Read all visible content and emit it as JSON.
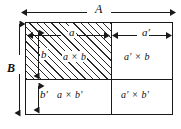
{
  "figure": {
    "colors": {
      "line": "#1a1a1a",
      "hatch": "#2a2a2a",
      "background": "#ffffff",
      "text": "#0d0d0d"
    }
  },
  "dimensions": {
    "total_width_label": "A",
    "total_height_label": "B",
    "left_width_label": "a",
    "right_width_label": "a′",
    "top_height_label": "b",
    "bottom_height_label": "b′"
  },
  "cells": {
    "top_left": {
      "label": "a × b",
      "hatched": true
    },
    "top_right": {
      "label": "a′ × b",
      "hatched": false
    },
    "bottom_left": {
      "label": "a × b′",
      "hatched": false
    },
    "bottom_right": {
      "label": "a′ × b′",
      "hatched": false
    }
  },
  "arrows": {
    "a_total": "double-headed-horizontal-arrow",
    "b_total": "double-headed-vertical-arrow",
    "a_segment": "double-headed-horizontal-arrow",
    "a_prime_segment": "double-headed-horizontal-arrow",
    "b_segment": "double-headed-vertical-arrow",
    "b_prime_segment": "double-headed-vertical-arrow"
  }
}
